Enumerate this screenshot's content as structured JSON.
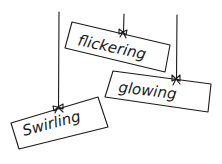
{
  "illustration": {
    "signs": [
      {
        "label": "flickering"
      },
      {
        "label": "glowing"
      },
      {
        "label": "Swirling"
      }
    ]
  },
  "colors": {
    "ink": "#1a1a1a",
    "background": "#ffffff"
  }
}
